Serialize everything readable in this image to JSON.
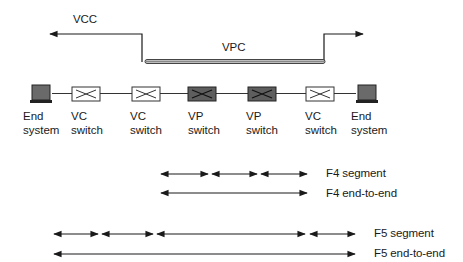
{
  "connections": {
    "vcc_label": "VCC",
    "vpc_label": "VPC"
  },
  "devices": [
    {
      "line1": "End",
      "line2": "system",
      "kind": "end-system",
      "x": 31
    },
    {
      "line1": "VC",
      "line2": "switch",
      "kind": "vc-switch",
      "x": 72
    },
    {
      "line1": "VC",
      "line2": "switch",
      "kind": "vc-switch",
      "x": 132
    },
    {
      "line1": "VP",
      "line2": "switch",
      "kind": "vp-switch",
      "x": 188
    },
    {
      "line1": "VP",
      "line2": "switch",
      "kind": "vp-switch",
      "x": 248
    },
    {
      "line1": "VC",
      "line2": "switch",
      "kind": "vc-switch",
      "x": 306
    },
    {
      "line1": "End",
      "line2": "system",
      "kind": "end-system",
      "x": 356
    }
  ],
  "flows": {
    "f4_segment": "F4 segment",
    "f4_end_to_end": "F4 end-to-end",
    "f5_segment": "F5 segment",
    "f5_end_to_end": "F5 end-to-end"
  },
  "colors": {
    "line": "#1a1a1a",
    "vp_switch_fill": "#5e5e5e",
    "end_system_fill": "#6a6a6a",
    "vpc_tube": "#9a9a9a"
  }
}
